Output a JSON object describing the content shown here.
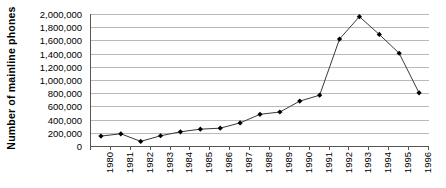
{
  "chart_data": {
    "type": "line",
    "title": "",
    "xlabel": "",
    "ylabel": "Number of mainline phones",
    "categories": [
      "1980",
      "1981",
      "1982",
      "1983",
      "1984",
      "1985",
      "1986",
      "1987",
      "1988",
      "1989",
      "1990",
      "1991",
      "1992",
      "1993",
      "1994",
      "1995",
      "1996"
    ],
    "values": [
      150000,
      185000,
      70000,
      155000,
      215000,
      255000,
      270000,
      350000,
      480000,
      515000,
      680000,
      770000,
      1620000,
      1960000,
      1690000,
      1405000,
      805000
    ],
    "series": [
      {
        "name": "Number of mainline phones",
        "values": [
          150000,
          185000,
          70000,
          155000,
          215000,
          255000,
          270000,
          350000,
          480000,
          515000,
          680000,
          770000,
          1620000,
          1960000,
          1690000,
          1405000,
          805000
        ]
      }
    ],
    "ylim": [
      0,
      2000000
    ],
    "ytick_step": 200000,
    "ytick_labels": [
      "2,000,000",
      "1,800,000",
      "1,600,000",
      "1,400,000",
      "1,200,000",
      "1,000,000",
      "800,000",
      "600,000",
      "400,000",
      "200,000",
      "0"
    ],
    "ytick_values": [
      2000000,
      1800000,
      1600000,
      1400000,
      1200000,
      1000000,
      800000,
      600000,
      400000,
      200000,
      0
    ],
    "grid": "horizontal",
    "legend": "none",
    "marker": "diamond",
    "line_color": "#3a3a3a",
    "marker_color": "#000000",
    "grid_color": "#b9b9b9",
    "axis_color": "#555555",
    "background_color": "#ffffff"
  }
}
